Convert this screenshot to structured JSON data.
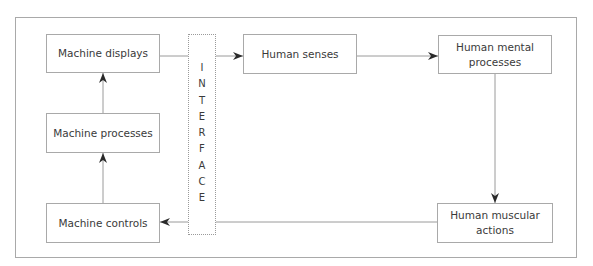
{
  "diagram": {
    "type": "flow-loop",
    "nodes": [
      {
        "id": "machine_displays",
        "label": "Machine displays"
      },
      {
        "id": "human_senses",
        "label": "Human senses"
      },
      {
        "id": "human_mental_processes",
        "label": "Human mental processes"
      },
      {
        "id": "human_muscular_actions",
        "label": "Human muscular actions"
      },
      {
        "id": "machine_controls",
        "label": "Machine controls"
      },
      {
        "id": "machine_processes",
        "label": "Machine processes"
      }
    ],
    "interface": {
      "label": "INTERFACE",
      "letters": [
        "I",
        "N",
        "T",
        "E",
        "R",
        "F",
        "A",
        "C",
        "E"
      ]
    },
    "edges": [
      {
        "from": "machine_displays",
        "to": "human_senses",
        "crosses": "interface"
      },
      {
        "from": "human_senses",
        "to": "human_mental_processes"
      },
      {
        "from": "human_mental_processes",
        "to": "human_muscular_actions"
      },
      {
        "from": "human_muscular_actions",
        "to": "machine_controls",
        "crosses": "interface"
      },
      {
        "from": "machine_controls",
        "to": "machine_processes"
      },
      {
        "from": "machine_processes",
        "to": "machine_displays"
      }
    ],
    "colors": {
      "border": "#a9a9a9",
      "line": "#9a9a9a",
      "arrowhead": "#2a2a2a",
      "text": "#3a3a3a"
    }
  }
}
